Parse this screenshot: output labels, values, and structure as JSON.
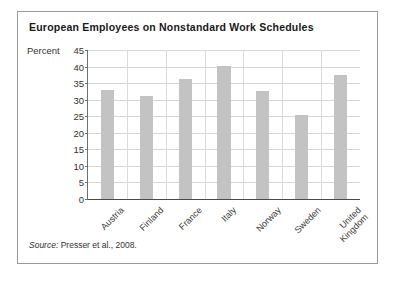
{
  "figure": {
    "title": "European Employees on Nonstandard Work Schedules",
    "source_prefix": "Source:",
    "source_text": " Presser et al., 2008.",
    "border_color": "#9a9a9a",
    "bar_color": "#c3c3c3",
    "gridline_color": "#d6d6d6"
  },
  "chart_data": {
    "type": "bar",
    "title": "European Employees on Nonstandard Work Schedules",
    "xlabel": "",
    "ylabel": "Percent",
    "ylim": [
      0,
      45
    ],
    "ytick_step": 5,
    "yticks": [
      45,
      40,
      35,
      30,
      25,
      20,
      15,
      10,
      5,
      0
    ],
    "ytick_labels": [
      "45",
      "40",
      "35",
      "30",
      "25",
      "20",
      "15",
      "10",
      "5",
      "0"
    ],
    "grid": true,
    "legend": false,
    "categories": [
      "Austria",
      "Finland",
      "France",
      "Italy",
      "Norway",
      "Sweden",
      "United Kingdom"
    ],
    "category_label_lines": [
      [
        "Austria"
      ],
      [
        "Finland"
      ],
      [
        "France"
      ],
      [
        "Italy"
      ],
      [
        "Norway"
      ],
      [
        "Sweden"
      ],
      [
        "United",
        "Kingdom"
      ]
    ],
    "values": [
      33.0,
      31.1,
      36.2,
      40.3,
      32.5,
      25.5,
      37.6
    ],
    "series": [
      {
        "name": "Percent on nonstandard work schedules",
        "values": [
          33.0,
          31.1,
          36.2,
          40.3,
          32.5,
          25.5,
          37.6
        ]
      }
    ],
    "source": "Source: Presser et al., 2008."
  }
}
